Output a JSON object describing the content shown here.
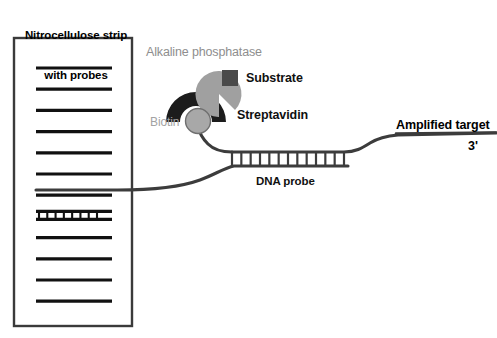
{
  "figure": {
    "width": 497,
    "height": 338,
    "background": "#ffffff"
  },
  "labels": {
    "strip_title_line1": "Nitrocellulose strip",
    "strip_title_line2": "with probes",
    "alkaline_phosphatase": "Alkaline phosphatase",
    "substrate": "Substrate",
    "streptavidin": "Streptavidin",
    "biotin": "Biotin",
    "dna_probe": "DNA probe",
    "amplified_target": "Amplified target",
    "three_prime": "3'"
  },
  "colors": {
    "strip_border": "#3a3a3a",
    "band": "#111111",
    "alkaline_phosphatase_shape": "#1c1c1c",
    "streptavidin_shape": "#a0a0a0",
    "substrate_shape": "#4a4a4a",
    "biotin_shape": "#a8a8a8",
    "biotin_outline": "#6f6f6f",
    "strand": "#3c3c3c",
    "label_gray": "#8e8e8e",
    "label_black": "#101010",
    "background": "#ffffff"
  },
  "strip": {
    "x": 14,
    "y": 38,
    "width": 118,
    "height": 288,
    "border_width": 2.4,
    "band_left": 36,
    "band_right": 112,
    "band_thickness": 3.2,
    "band_count": 12,
    "first_band_y": 68,
    "band_spacing": 21.2,
    "hybridized_band_index": 7,
    "hybridized_rungs": 7
  },
  "hybridization": {
    "rung_count": 12,
    "region_x_start": 232,
    "region_x_end": 344,
    "top_strand_y": 152,
    "bottom_strand_y": 166,
    "rung_width": 2.2
  },
  "complex": {
    "alkaline_phosphatase": {
      "cx": 196,
      "cy": 115,
      "radius": 30,
      "note": "black crescent dome"
    },
    "streptavidin": {
      "cx": 219,
      "cy": 94,
      "radius": 23,
      "note": "gray pac-man wedge open to lower right"
    },
    "substrate": {
      "x": 222,
      "y": 70,
      "size": 16
    },
    "biotin": {
      "cx": 198,
      "cy": 121,
      "radius": 13
    }
  },
  "label_positions": {
    "strip_title": {
      "x": 17,
      "y": 4
    },
    "alkaline_phosphatase": {
      "x": 146,
      "y": 46
    },
    "substrate": {
      "x": 245,
      "y": 73
    },
    "streptavidin": {
      "x": 237,
      "y": 110
    },
    "biotin": {
      "x": 150,
      "y": 117
    },
    "dna_probe": {
      "x": 256,
      "y": 176
    },
    "amplified_target": {
      "x": 396,
      "y": 120
    },
    "three_prime": {
      "x": 468,
      "y": 140
    }
  }
}
